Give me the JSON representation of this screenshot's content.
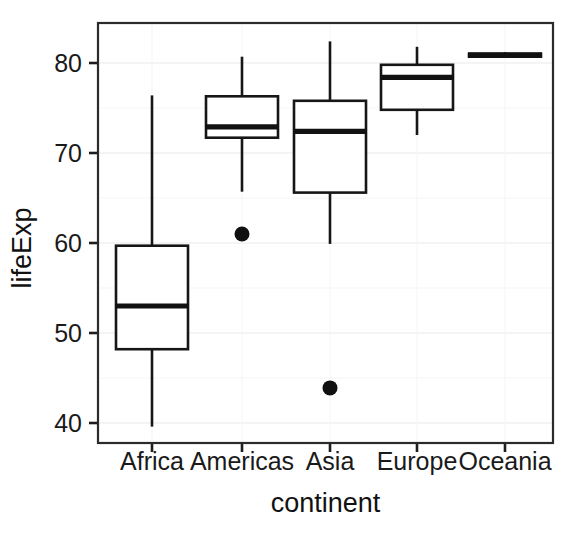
{
  "chart_data": {
    "type": "box",
    "title": "",
    "xlabel": "continent",
    "ylabel": "lifeExp",
    "categories": [
      "Africa",
      "Americas",
      "Asia",
      "Europe",
      "Oceania"
    ],
    "ylim": [
      37.5,
      83.8
    ],
    "xtick_labels": [
      "Africa",
      "Americas",
      "Asia",
      "Europe",
      "Oceania"
    ],
    "ytick_labels": [
      "40",
      "50",
      "60",
      "70",
      "80"
    ],
    "ytick_values": [
      40,
      50,
      60,
      70,
      80
    ],
    "yminor_values": [
      45,
      55,
      65,
      75
    ],
    "grid": "major and minor horizontal, minor vertical at category centers",
    "legend": "none",
    "boxes": [
      {
        "category": "Africa",
        "whisker_low": 39.6,
        "q1": 48.2,
        "median": 53.0,
        "q3": 59.7,
        "whisker_high": 76.4,
        "outliers": []
      },
      {
        "category": "Americas",
        "whisker_low": 65.7,
        "q1": 71.7,
        "median": 72.9,
        "q3": 76.3,
        "whisker_high": 80.7,
        "outliers": [
          61.0
        ]
      },
      {
        "category": "Asia",
        "whisker_low": 59.9,
        "q1": 65.6,
        "median": 72.4,
        "q3": 75.8,
        "whisker_high": 82.4,
        "outliers": [
          43.9
        ]
      },
      {
        "category": "Europe",
        "whisker_low": 72.0,
        "q1": 74.8,
        "median": 78.4,
        "q3": 79.8,
        "whisker_high": 81.8,
        "outliers": []
      },
      {
        "category": "Oceania",
        "whisker_low": 80.7,
        "q1": 80.7,
        "median": 80.9,
        "q3": 81.0,
        "whisker_high": 81.2,
        "outliers": []
      }
    ]
  },
  "colors": {
    "background": "#ffffff",
    "ink": "#161616",
    "panel_border": "#2b2b2b",
    "grid_major": "#e9e9e9",
    "grid_minor": "#f4f4f4"
  },
  "geometry": {
    "panel_left": 98,
    "panel_right": 553,
    "panel_top": 23,
    "panel_bottom": 443,
    "y_at_80": 63,
    "y_at_40": 423,
    "x_ticks": [
      152,
      242,
      330,
      417,
      505
    ],
    "box_half_width": 36,
    "xlabel_y": 470,
    "xtitle_y": 512,
    "ytitle_x": 31,
    "ytitle_y": 248
  }
}
